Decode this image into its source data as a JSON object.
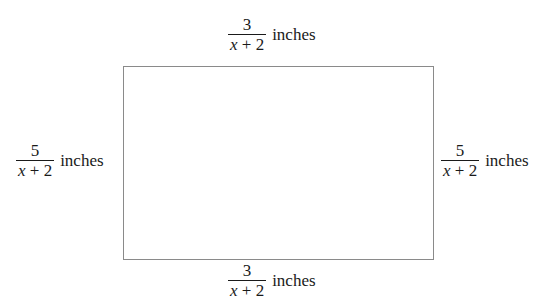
{
  "diagram": {
    "shape": "rectangle",
    "sides": {
      "top": {
        "numerator": "3",
        "denominator_var": "x",
        "denominator_rest": " + 2",
        "unit": "inches"
      },
      "left": {
        "numerator": "5",
        "denominator_var": "x",
        "denominator_rest": " + 2",
        "unit": "inches"
      },
      "right": {
        "numerator": "5",
        "denominator_var": "x",
        "denominator_rest": " + 2",
        "unit": "inches"
      },
      "bottom": {
        "numerator": "3",
        "denominator_var": "x",
        "denominator_rest": " + 2",
        "unit": "inches"
      }
    },
    "colors": {
      "border": "#8a8a8a",
      "text": "#1a1a1a"
    }
  }
}
